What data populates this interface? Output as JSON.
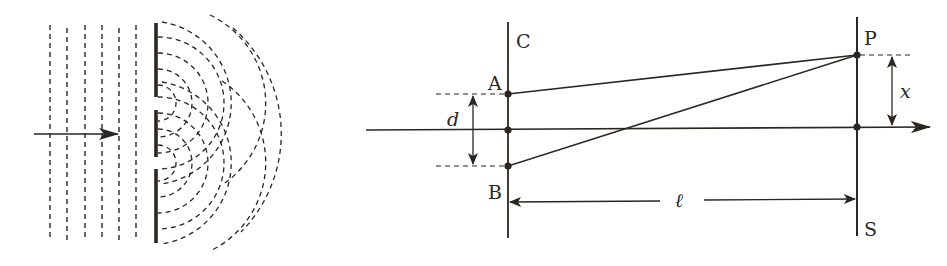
{
  "colors": {
    "ink": "#2a2622",
    "background": "#ffffff"
  },
  "left_panel": {
    "description": "Plane waves incident on a double slit, producing circular diffracted wavefronts",
    "incident_arrow": {
      "x1": 34,
      "x2": 118,
      "y": 134
    },
    "plane_wavefronts_x": [
      50,
      67,
      85,
      102,
      119,
      136
    ],
    "wavefront_y_range": [
      25,
      241
    ],
    "barrier": {
      "x": 156,
      "segments": [
        [
          23,
          97
        ],
        [
          110,
          157
        ],
        [
          169,
          243
        ]
      ]
    },
    "slit_centers_y": [
      103,
      163
    ],
    "circular_wave_radii": [
      18,
      34,
      50,
      66,
      82,
      98
    ]
  },
  "right_panel": {
    "labels": {
      "barrier": "C",
      "screen": "S",
      "slit_top": "A",
      "slit_bottom": "B",
      "point": "P",
      "slit_separation": "d",
      "distance": "ℓ",
      "displacement": "x"
    },
    "axis": {
      "x1": 366,
      "x2": 930,
      "y": 130
    },
    "barrier_line": {
      "x": 508,
      "y1": 22,
      "y2": 238
    },
    "screen_line": {
      "x": 857,
      "y1": 17,
      "y2": 236
    },
    "points": {
      "A": {
        "x": 508,
        "y": 94
      },
      "O": {
        "x": 508,
        "y": 130
      },
      "B": {
        "x": 508,
        "y": 166
      },
      "P": {
        "x": 857,
        "y": 55
      },
      "O_screen": {
        "x": 857,
        "y": 127
      }
    },
    "d_arrow_x": 473,
    "x_arrow_x": 892,
    "l_arrow_y": 201
  }
}
